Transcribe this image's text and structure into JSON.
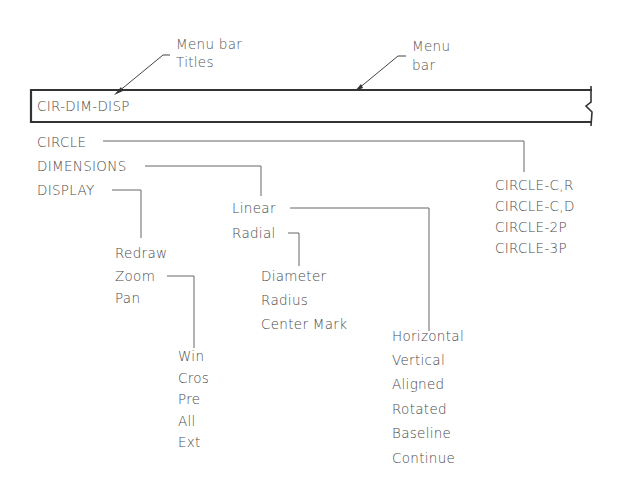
{
  "callouts": {
    "menu_bar_titles": [
      "Menu  bar",
      "Titles"
    ],
    "menu_bar": [
      "Menu",
      "bar"
    ]
  },
  "menu_bar": {
    "title": "CIR-DIM-DISP"
  },
  "top_menu": [
    "CIRCLE",
    "DIMENSIONS",
    "DISPLAY"
  ],
  "circle_menu": [
    "CIRCLE-C,R",
    "CIRCLE-C,D",
    "CIRCLE-2P",
    "CIRCLE-3P"
  ],
  "dimensions_menu": [
    "Linear",
    "Radial"
  ],
  "radial_menu": [
    "Diameter",
    "Radius",
    "Center  Mark"
  ],
  "linear_menu": [
    "Horizontal",
    "Vertical",
    "Aligned",
    "Rotated",
    "Baseline",
    "Continue"
  ],
  "display_menu": [
    "Redraw",
    "Zoom",
    "Pan"
  ],
  "zoom_menu": [
    "Win",
    "Cros",
    "Pre",
    "All",
    "Ext"
  ],
  "colors": {
    "line": "#555555",
    "bar_border": "#333333",
    "text": "#4a4a4a"
  }
}
